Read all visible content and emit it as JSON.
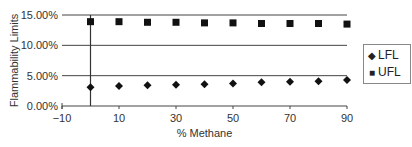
{
  "chart_data": {
    "type": "scatter",
    "title": "",
    "xlabel": "% Methane",
    "ylabel": "Flammability Limits",
    "xlim": [
      -10,
      90
    ],
    "ylim": [
      0,
      15
    ],
    "x_ticks": [
      "-10",
      "10",
      "30",
      "50",
      "70",
      "90"
    ],
    "y_ticks": [
      "0.00%",
      "5.00%",
      "10.00%",
      "15.00%"
    ],
    "grid": "horizontal",
    "legend_position": "right",
    "x": [
      0,
      10,
      20,
      30,
      40,
      50,
      60,
      70,
      80,
      90
    ],
    "series": [
      {
        "name": "LFL",
        "marker": "diamond",
        "values": [
          3.1,
          3.3,
          3.4,
          3.5,
          3.6,
          3.7,
          3.9,
          4.0,
          4.1,
          4.3
        ]
      },
      {
        "name": "UFL",
        "marker": "square",
        "values": [
          13.9,
          13.9,
          13.8,
          13.8,
          13.7,
          13.7,
          13.6,
          13.6,
          13.6,
          13.5
        ]
      }
    ]
  },
  "legend": {
    "items": [
      {
        "label": "LFL",
        "icon": "diamond-icon"
      },
      {
        "label": "UFL",
        "icon": "square-icon"
      }
    ]
  }
}
